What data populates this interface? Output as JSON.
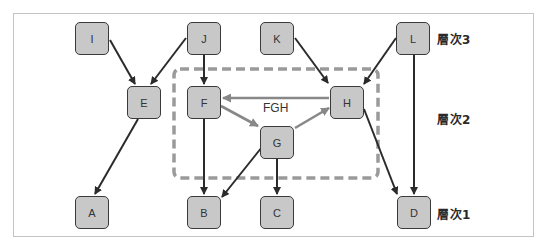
{
  "diagram": {
    "type": "layered-dependency-graph",
    "levels": [
      {
        "id": "level3",
        "label": "層次3",
        "nodes": [
          "I",
          "J",
          "K",
          "L"
        ]
      },
      {
        "id": "level2",
        "label": "層次2",
        "nodes": [
          "E",
          "F",
          "G",
          "H"
        ]
      },
      {
        "id": "level1",
        "label": "層次1",
        "nodes": [
          "A",
          "B",
          "C",
          "D"
        ]
      }
    ],
    "nodes": {
      "I": {
        "label": "I"
      },
      "J": {
        "label": "J"
      },
      "K": {
        "label": "K"
      },
      "L": {
        "label": "L"
      },
      "E": {
        "label": "E"
      },
      "F": {
        "label": "F"
      },
      "G": {
        "label": "G"
      },
      "H": {
        "label": "H"
      },
      "A": {
        "label": "A"
      },
      "B": {
        "label": "B"
      },
      "C": {
        "label": "C"
      },
      "D": {
        "label": "D"
      }
    },
    "group": {
      "label": "FGH",
      "members": [
        "F",
        "G",
        "H"
      ],
      "style": "dashed",
      "color": "#999999"
    },
    "edges": [
      {
        "from": "I",
        "to": "E",
        "style": "dark"
      },
      {
        "from": "J",
        "to": "E",
        "style": "dark"
      },
      {
        "from": "J",
        "to": "F",
        "style": "dark"
      },
      {
        "from": "K",
        "to": "H",
        "style": "dark"
      },
      {
        "from": "L",
        "to": "H",
        "style": "dark"
      },
      {
        "from": "L",
        "to": "D",
        "style": "dark"
      },
      {
        "from": "E",
        "to": "A",
        "style": "dark"
      },
      {
        "from": "F",
        "to": "B",
        "style": "dark"
      },
      {
        "from": "G",
        "to": "B",
        "style": "dark"
      },
      {
        "from": "G",
        "to": "C",
        "style": "dark"
      },
      {
        "from": "H",
        "to": "D",
        "style": "dark"
      },
      {
        "from": "H",
        "to": "F",
        "style": "cycle"
      },
      {
        "from": "F",
        "to": "G",
        "style": "cycle"
      },
      {
        "from": "G",
        "to": "H",
        "style": "cycle"
      }
    ],
    "colors": {
      "node_fill": "#c8c8c8",
      "node_border": "#3a3a3a",
      "edge_dark": "#2b2b2b",
      "edge_cycle": "#888888",
      "group_border": "#9a9a9a"
    }
  }
}
